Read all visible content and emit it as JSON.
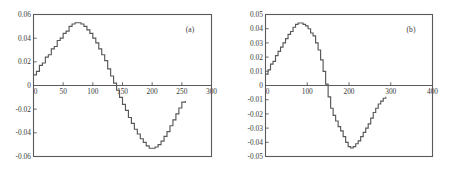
{
  "figure": {
    "background": "#ffffff",
    "axis_color": "#5a5a5a",
    "curve_color": "#585858",
    "text_color": "#3a3a3a"
  },
  "chart_data": [
    {
      "type": "line",
      "panel_label": "(a)",
      "title": "",
      "xlabel": "",
      "ylabel": "",
      "xlim": [
        0,
        300
      ],
      "ylim": [
        -0.06,
        0.06
      ],
      "grid": false,
      "legend": "none",
      "xticks": [
        0,
        50,
        100,
        150,
        200,
        250,
        300
      ],
      "xticklabels": [
        "0",
        "50",
        "100",
        "150",
        "200",
        "250",
        "300"
      ],
      "yticks": [
        0.06,
        0.04,
        0.02,
        0,
        -0.02,
        -0.04,
        -0.06
      ],
      "yticklabels": [
        "0.06",
        "0.04",
        "0.02",
        "0",
        "-0.02",
        "-0.04",
        "-0.06"
      ],
      "series": [
        {
          "name": "quantized sine",
          "style": "staircase",
          "x": [
            0,
            5,
            10,
            15,
            20,
            25,
            30,
            35,
            40,
            45,
            50,
            55,
            60,
            65,
            70,
            75,
            80,
            85,
            90,
            95,
            100,
            105,
            110,
            115,
            120,
            125,
            130,
            135,
            140,
            145,
            150,
            155,
            160,
            165,
            170,
            175,
            180,
            185,
            190,
            195,
            200,
            205,
            210,
            215,
            220,
            225,
            230,
            235,
            240,
            245,
            250,
            256
          ],
          "y": [
            0.009,
            0.012,
            0.017,
            0.019,
            0.024,
            0.026,
            0.031,
            0.033,
            0.038,
            0.04,
            0.044,
            0.046,
            0.05,
            0.052,
            0.053,
            0.053,
            0.052,
            0.05,
            0.047,
            0.044,
            0.04,
            0.036,
            0.031,
            0.026,
            0.021,
            0.014,
            0.008,
            0.002,
            -0.004,
            -0.01,
            -0.016,
            -0.021,
            -0.027,
            -0.032,
            -0.037,
            -0.041,
            -0.045,
            -0.048,
            -0.051,
            -0.053,
            -0.053,
            -0.052,
            -0.05,
            -0.047,
            -0.043,
            -0.039,
            -0.034,
            -0.029,
            -0.024,
            -0.019,
            -0.014,
            -0.013
          ]
        }
      ]
    },
    {
      "type": "line",
      "panel_label": "(b)",
      "title": "",
      "xlabel": "",
      "ylabel": "",
      "xlim": [
        0,
        400
      ],
      "ylim": [
        -0.05,
        0.05
      ],
      "grid": false,
      "legend": "none",
      "xticks": [
        0,
        100,
        200,
        300,
        400
      ],
      "xticklabels": [
        "0",
        "100",
        "200",
        "300",
        "400"
      ],
      "yticks": [
        0.05,
        0.04,
        0.03,
        0.02,
        0.01,
        0,
        -0.01,
        -0.02,
        -0.03,
        -0.04,
        -0.05
      ],
      "yticklabels": [
        "0.05",
        "0.04",
        "0.03",
        "0.02",
        "0.01",
        "0",
        "-0.01",
        "-0.02",
        "-0.03",
        "-0.04",
        "-0.05"
      ],
      "series": [
        {
          "name": "quantized sine",
          "style": "staircase",
          "x": [
            0,
            6,
            12,
            18,
            24,
            30,
            36,
            42,
            48,
            54,
            60,
            66,
            72,
            78,
            84,
            90,
            96,
            102,
            108,
            114,
            120,
            126,
            132,
            138,
            144,
            150,
            156,
            162,
            168,
            174,
            180,
            186,
            192,
            198,
            204,
            210,
            216,
            222,
            228,
            234,
            240,
            246,
            252,
            258,
            264,
            270,
            276,
            282,
            288
          ],
          "y": [
            0.008,
            0.011,
            0.015,
            0.017,
            0.021,
            0.024,
            0.027,
            0.03,
            0.033,
            0.036,
            0.038,
            0.041,
            0.043,
            0.044,
            0.044,
            0.043,
            0.042,
            0.04,
            0.037,
            0.035,
            0.03,
            0.025,
            0.018,
            0.01,
            0.001,
            -0.008,
            -0.016,
            -0.021,
            -0.025,
            -0.029,
            -0.032,
            -0.036,
            -0.04,
            -0.043,
            -0.044,
            -0.043,
            -0.041,
            -0.039,
            -0.036,
            -0.033,
            -0.03,
            -0.027,
            -0.023,
            -0.019,
            -0.016,
            -0.013,
            -0.011,
            -0.009,
            -0.008
          ]
        }
      ]
    }
  ]
}
